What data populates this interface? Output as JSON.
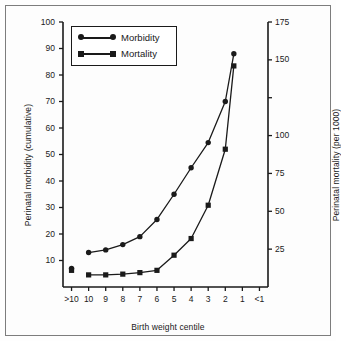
{
  "chart_data": {
    "type": "line",
    "title": "",
    "xlabel": "Birth weight centile",
    "ylabel": "Perinatal morbidity (cumulative)",
    "y2label": "Perinatal mortality (per 1000)",
    "categories": [
      ">10",
      "10",
      "9",
      "8",
      "7",
      "6",
      "5",
      "4",
      "3",
      "2",
      "1",
      "<1"
    ],
    "ylim": [
      0,
      100
    ],
    "yticks": [
      10,
      20,
      30,
      40,
      50,
      60,
      70,
      80,
      90,
      100
    ],
    "y2lim": [
      0,
      175
    ],
    "y2ticks": [
      25,
      50,
      75,
      100,
      125,
      150,
      175
    ],
    "y2ticklabels": [
      "25",
      "50",
      "75",
      "100",
      "125",
      "150",
      "175"
    ],
    "grid": false,
    "legend_position": "upper left",
    "series": [
      {
        "name": "Morbidity",
        "axis": "left",
        "marker": "circle",
        "detached_first_point": true,
        "points": [
          {
            "x": ">10",
            "y": 7
          },
          {
            "x": "10",
            "y": 13
          },
          {
            "x": "9",
            "y": 14
          },
          {
            "x": "8",
            "y": 16
          },
          {
            "x": "7",
            "y": 19
          },
          {
            "x": "6",
            "y": 25.5
          },
          {
            "x": "5",
            "y": 35
          },
          {
            "x": "4",
            "y": 45
          },
          {
            "x": "3",
            "y": 54.5
          },
          {
            "x": "2",
            "y": 70
          },
          {
            "x": "1.5",
            "y": 88
          }
        ]
      },
      {
        "name": "Mortality",
        "axis": "right",
        "marker": "square",
        "detached_first_point": true,
        "points": [
          {
            "x": ">10",
            "y": 11
          },
          {
            "x": "10",
            "y": 8
          },
          {
            "x": "9",
            "y": 8
          },
          {
            "x": "8",
            "y": 8.5
          },
          {
            "x": "7",
            "y": 9.5
          },
          {
            "x": "6",
            "y": 11
          },
          {
            "x": "5",
            "y": 21
          },
          {
            "x": "4",
            "y": 32
          },
          {
            "x": "3",
            "y": 54
          },
          {
            "x": "2",
            "y": 91
          },
          {
            "x": "1.5",
            "y": 146
          }
        ]
      }
    ]
  },
  "legend": {
    "entries": [
      {
        "label": "Morbidity",
        "marker": "circle"
      },
      {
        "label": "Mortality",
        "marker": "square"
      }
    ]
  },
  "axes": {
    "x_title": "Birth weight centile",
    "y_left_title": "Perinatal morbidity (cumulative)",
    "y_right_title": "Perinatal mortality (per 1000)",
    "x_tick_labels": [
      ">10",
      "10",
      "9",
      "8",
      "7",
      "6",
      "5",
      "4",
      "3",
      "2",
      "1",
      "<1"
    ],
    "y_left_tick_labels": [
      "100",
      "90",
      "80",
      "70",
      "60",
      "50",
      "40",
      "30",
      "20",
      "10"
    ],
    "y_right_tick_labels": [
      "175",
      "150",
      "125",
      "100",
      "75",
      "50",
      "25"
    ]
  },
  "colors": {
    "ink": "#1a1a1a",
    "frame": "#7d7d7d",
    "background": "#fdfdfd"
  }
}
